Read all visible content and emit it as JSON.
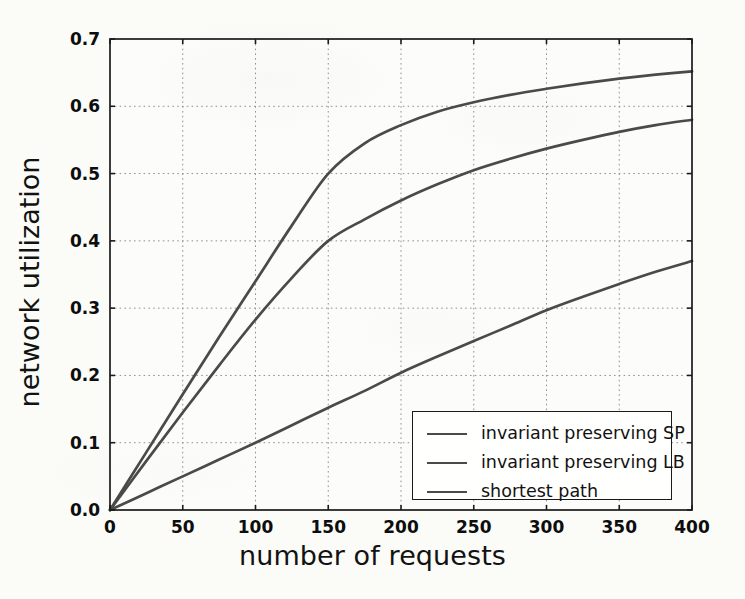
{
  "chart_data": {
    "type": "line",
    "title": "",
    "xlabel": "number of requests",
    "ylabel": "network utilization",
    "xlim": [
      0,
      400
    ],
    "ylim": [
      0.0,
      0.7
    ],
    "xticks": [
      "0",
      "50",
      "100",
      "150",
      "200",
      "250",
      "300",
      "350",
      "400"
    ],
    "yticks": [
      "0.0",
      "0.1",
      "0.2",
      "0.3",
      "0.4",
      "0.5",
      "0.6",
      "0.7"
    ],
    "grid": true,
    "legend_position": "lower right",
    "x": [
      0,
      25,
      50,
      75,
      100,
      125,
      150,
      175,
      200,
      225,
      250,
      275,
      300,
      325,
      350,
      375,
      400
    ],
    "series": [
      {
        "name": "invariant preserving SP",
        "color": "#4a4a4a",
        "values": [
          0.0,
          0.086,
          0.172,
          0.257,
          0.34,
          0.423,
          0.5,
          0.545,
          0.572,
          0.592,
          0.606,
          0.617,
          0.626,
          0.634,
          0.641,
          0.647,
          0.652
        ]
      },
      {
        "name": "invariant preserving LB",
        "color": "#4a4a4a",
        "values": [
          0.0,
          0.073,
          0.145,
          0.215,
          0.283,
          0.345,
          0.4,
          0.432,
          0.46,
          0.484,
          0.505,
          0.522,
          0.537,
          0.55,
          0.562,
          0.572,
          0.58
        ]
      },
      {
        "name": "shortest path",
        "color": "#4a4a4a",
        "values": [
          0.0,
          0.025,
          0.05,
          0.075,
          0.1,
          0.126,
          0.152,
          0.177,
          0.204,
          0.228,
          0.251,
          0.274,
          0.297,
          0.317,
          0.336,
          0.354,
          0.37
        ]
      }
    ]
  },
  "legend": {
    "entries": [
      "invariant preserving SP",
      "invariant preserving LB",
      "shortest path"
    ]
  },
  "axes": {
    "x_label": "number of requests",
    "y_label": "network utilization"
  },
  "colors": {
    "line": "#4a4a4a",
    "axis": "#1a1a1a",
    "grid": "#9a9a9a",
    "background": "#fbfbf8"
  }
}
